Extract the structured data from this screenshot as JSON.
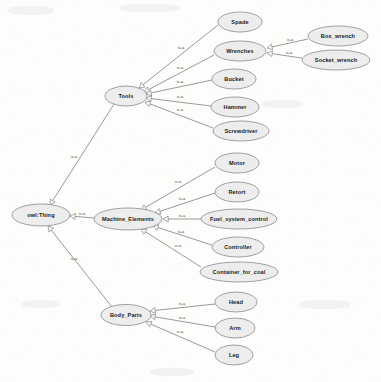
{
  "diagram": {
    "type": "ontology-tree",
    "edge_relation_label": "is-a",
    "colors": {
      "node_fill": "#ededed",
      "node_stroke": "#8a8a8a",
      "edge_stroke": "#6f6f6f",
      "background": "#fdfdfc",
      "text": "#1b1b1b"
    },
    "nodes": [
      {
        "id": "owl_thing",
        "label": "owl:Thing",
        "cx": 41,
        "cy": 215,
        "rx": 29,
        "ry": 11
      },
      {
        "id": "tools",
        "label": "Tools",
        "cx": 126,
        "cy": 96,
        "rx": 21,
        "ry": 10
      },
      {
        "id": "machine_elements",
        "label": "Machine_Elements",
        "cx": 128,
        "cy": 219,
        "rx": 34,
        "ry": 11
      },
      {
        "id": "body_parts",
        "label": "Body_Parts",
        "cx": 126,
        "cy": 315,
        "rx": 25,
        "ry": 10.5
      },
      {
        "id": "spade",
        "label": "Spade",
        "cx": 240,
        "cy": 22,
        "rx": 22,
        "ry": 10
      },
      {
        "id": "wrenches",
        "label": "Wrenches",
        "cx": 240,
        "cy": 51,
        "rx": 26,
        "ry": 10
      },
      {
        "id": "bucket",
        "label": "Bucket",
        "cx": 234,
        "cy": 79,
        "rx": 22,
        "ry": 10
      },
      {
        "id": "hammer",
        "label": "Hammer",
        "cx": 235,
        "cy": 107,
        "rx": 24,
        "ry": 10
      },
      {
        "id": "screwdriver",
        "label": "Screwdriver",
        "cx": 241,
        "cy": 131,
        "rx": 28,
        "ry": 10
      },
      {
        "id": "box_wrench",
        "label": "Box_wrench",
        "cx": 338,
        "cy": 36,
        "rx": 30,
        "ry": 10
      },
      {
        "id": "socket_wrench",
        "label": "Socket_wrench",
        "cx": 336,
        "cy": 60,
        "rx": 34,
        "ry": 10
      },
      {
        "id": "motor",
        "label": "Motor",
        "cx": 237,
        "cy": 163,
        "rx": 22,
        "ry": 10
      },
      {
        "id": "retort",
        "label": "Retort",
        "cx": 237,
        "cy": 192,
        "rx": 22,
        "ry": 10
      },
      {
        "id": "fuel_system_control",
        "label": "Fuel_system_control",
        "cx": 239,
        "cy": 219,
        "rx": 38,
        "ry": 10
      },
      {
        "id": "controller",
        "label": "Controller",
        "cx": 238,
        "cy": 247,
        "rx": 26,
        "ry": 10
      },
      {
        "id": "container_for_coal",
        "label": "Container_for_coal",
        "cx": 239,
        "cy": 272,
        "rx": 39,
        "ry": 10
      },
      {
        "id": "head",
        "label": "Head",
        "cx": 236,
        "cy": 302,
        "rx": 21,
        "ry": 10
      },
      {
        "id": "arm",
        "label": "Arm",
        "cx": 235,
        "cy": 328,
        "rx": 20,
        "ry": 10
      },
      {
        "id": "leg",
        "label": "Leg",
        "cx": 234,
        "cy": 355,
        "rx": 19,
        "ry": 10
      }
    ],
    "edges": [
      {
        "from": "tools",
        "to": "owl_thing",
        "label": "is-a",
        "x1": 114,
        "y1": 104,
        "x2": 50,
        "y2": 205,
        "lx": 74,
        "ly": 157
      },
      {
        "from": "machine_elements",
        "to": "owl_thing",
        "label": "is-a",
        "x1": 94,
        "y1": 218,
        "x2": 70,
        "y2": 216,
        "lx": 82,
        "ly": 214
      },
      {
        "from": "body_parts",
        "to": "owl_thing",
        "label": "is-a",
        "x1": 112,
        "y1": 307,
        "x2": 48,
        "y2": 226,
        "lx": 74,
        "ly": 259
      },
      {
        "from": "spade",
        "to": "tools",
        "label": "is-a",
        "x1": 218,
        "y1": 25,
        "x2": 139,
        "y2": 88,
        "lx": 181,
        "ly": 48
      },
      {
        "from": "wrenches",
        "to": "tools",
        "label": "is-a",
        "x1": 214,
        "y1": 55,
        "x2": 144,
        "y2": 92,
        "lx": 180,
        "ly": 68
      },
      {
        "from": "bucket",
        "to": "tools",
        "label": "is-a",
        "x1": 212,
        "y1": 80,
        "x2": 146,
        "y2": 94,
        "lx": 180,
        "ly": 82
      },
      {
        "from": "hammer",
        "to": "tools",
        "label": "is-a",
        "x1": 211,
        "y1": 106,
        "x2": 146,
        "y2": 98,
        "lx": 180,
        "ly": 97
      },
      {
        "from": "screwdriver",
        "to": "tools",
        "label": "is-a",
        "x1": 213,
        "y1": 128,
        "x2": 145,
        "y2": 102,
        "lx": 180,
        "ly": 110
      },
      {
        "from": "box_wrench",
        "to": "wrenches",
        "label": "is-a",
        "x1": 308,
        "y1": 39,
        "x2": 267,
        "y2": 48,
        "lx": 290,
        "ly": 40
      },
      {
        "from": "socket_wrench",
        "to": "wrenches",
        "label": "is-a",
        "x1": 302,
        "y1": 58,
        "x2": 267,
        "y2": 53,
        "lx": 289,
        "ly": 53
      },
      {
        "from": "motor",
        "to": "machine_elements",
        "label": "is-a",
        "x1": 215,
        "y1": 167,
        "x2": 141,
        "y2": 210,
        "lx": 178,
        "ly": 182
      },
      {
        "from": "retort",
        "to": "machine_elements",
        "label": "is-a",
        "x1": 215,
        "y1": 193,
        "x2": 155,
        "y2": 213,
        "lx": 182,
        "ly": 199
      },
      {
        "from": "fuel_system_control",
        "to": "machine_elements",
        "label": "is-a",
        "x1": 201,
        "y1": 219,
        "x2": 163,
        "y2": 219,
        "lx": 182,
        "ly": 216
      },
      {
        "from": "controller",
        "to": "machine_elements",
        "label": "is-a",
        "x1": 212,
        "y1": 245,
        "x2": 153,
        "y2": 226,
        "lx": 181,
        "ly": 232
      },
      {
        "from": "container_for_coal",
        "to": "machine_elements",
        "label": "is-a",
        "x1": 201,
        "y1": 267,
        "x2": 141,
        "y2": 229,
        "lx": 178,
        "ly": 246
      },
      {
        "from": "head",
        "to": "body_parts",
        "label": "is-a",
        "x1": 215,
        "y1": 304,
        "x2": 150,
        "y2": 311,
        "lx": 182,
        "ly": 304
      },
      {
        "from": "arm",
        "to": "body_parts",
        "label": "is-a",
        "x1": 215,
        "y1": 327,
        "x2": 150,
        "y2": 316,
        "lx": 182,
        "ly": 318
      },
      {
        "from": "leg",
        "to": "body_parts",
        "label": "is-a",
        "x1": 215,
        "y1": 352,
        "x2": 146,
        "y2": 322,
        "lx": 180,
        "ly": 332
      }
    ]
  }
}
